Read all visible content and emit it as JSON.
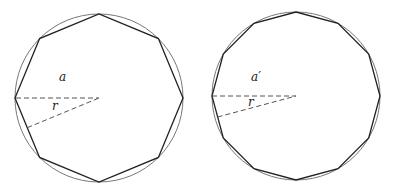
{
  "figures": [
    {
      "name": "octagon-inscribed",
      "polygon_sides": 8,
      "apothem_label": "a",
      "radius_label": "r"
    },
    {
      "name": "dodecagon-inscribed",
      "polygon_sides": 12,
      "apothem_label": "a′",
      "radius_label": "r"
    }
  ],
  "colors": {
    "circle": "#777777",
    "polygon": "#222222",
    "dashed": "#555555"
  }
}
